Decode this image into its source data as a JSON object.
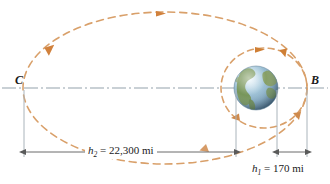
{
  "figure": {
    "type": "orbit-transfer-diagram",
    "background_color": "#ffffff",
    "points": [
      {
        "id": "C",
        "label": "C",
        "x": 24,
        "y": 88,
        "role": "apogee-left"
      },
      {
        "id": "B",
        "label": "B",
        "x": 307,
        "y": 88,
        "role": "perigee-right"
      }
    ],
    "body": {
      "name": "earth-globe",
      "center_x": 256,
      "center_y": 88,
      "radius": 22,
      "ocean_color": "#7fa8c4",
      "land_color": "#6f8a45",
      "highlight_color": "#dcebf4"
    },
    "orbits": [
      {
        "name": "transfer-ellipse",
        "style": "dashed",
        "color": "#d08a4a",
        "cx": 165,
        "cy": 88,
        "rx": 142,
        "ry": 76,
        "direction": "counterclockwise"
      },
      {
        "name": "circular-parking-orbit",
        "style": "dashed",
        "color": "#d08a4a",
        "cx": 264,
        "cy": 88,
        "rx": 43,
        "ry": 40,
        "direction": "counterclockwise"
      }
    ],
    "axis": {
      "name": "center-line",
      "style": "dash-dot",
      "color": "#8c9aa5",
      "y": 88,
      "x_start": 2,
      "x_end": 328
    },
    "dimensions": [
      {
        "id": "h2",
        "symbol": "h",
        "subscript": "2",
        "value": "22,300",
        "unit": "mi",
        "text": "h2 = 22,300 mi",
        "from_x": 24,
        "to_x": 236,
        "y": 152,
        "color": "#5a5a5a"
      },
      {
        "id": "h1",
        "symbol": "h",
        "subscript": "1",
        "value": "170",
        "unit": "mi",
        "text": "h1 = 170 mi",
        "from_x": 277,
        "to_x": 307,
        "y": 152,
        "color": "#5a5a5a"
      }
    ],
    "extension_lines": [
      {
        "name": "ext-line-C",
        "x": 24,
        "y_top": 88,
        "y_bottom": 156
      },
      {
        "name": "ext-line-earth-left",
        "x": 236,
        "y_top": 90,
        "y_bottom": 156
      },
      {
        "name": "ext-line-earth-right",
        "x": 277,
        "y_top": 90,
        "y_bottom": 156
      },
      {
        "name": "ext-line-B",
        "x": 307,
        "y_top": 90,
        "y_bottom": 156
      }
    ]
  },
  "labels": {
    "point_c": "C",
    "point_b": "B",
    "h2_symbol": "h",
    "h2_sub": "2",
    "h2_rest": " = 22,300 mi",
    "h1_symbol": "h",
    "h1_sub": "1",
    "h1_rest": " = 170 mi"
  }
}
